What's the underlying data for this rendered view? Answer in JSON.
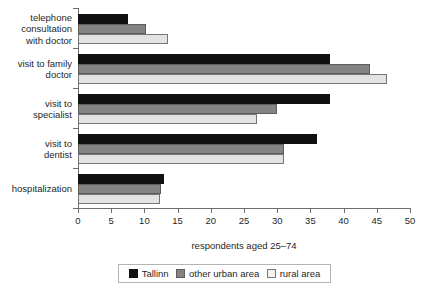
{
  "chart_data": {
    "type": "bar",
    "orientation": "horizontal",
    "title": "",
    "xlabel": "respondents aged 25–74",
    "ylabel": "",
    "xlim": [
      0,
      50
    ],
    "xticks": [
      0,
      5,
      10,
      15,
      20,
      25,
      30,
      35,
      40,
      45,
      50
    ],
    "xtick_labels": [
      "0",
      "5",
      "10",
      "15",
      "20",
      "25",
      "30",
      "35",
      "40",
      "45",
      "50"
    ],
    "grid": false,
    "legend_position": "bottom",
    "categories": [
      "telephone\nconsultation\nwith doctor",
      "visit to family\ndoctor",
      "visit to\nspecialist",
      "visit to\ndentist",
      "hospitalization"
    ],
    "series": [
      {
        "name": "Tallinn",
        "color": "#111111",
        "values": [
          7.5,
          38.0,
          38.0,
          36.0,
          13.0
        ]
      },
      {
        "name": "other urban area",
        "color": "#848484",
        "values": [
          10.2,
          44.0,
          30.0,
          31.0,
          12.5
        ]
      },
      {
        "name": "rural area",
        "color": "#e2e2e2",
        "values": [
          13.5,
          46.5,
          27.0,
          31.0,
          12.3
        ]
      }
    ]
  },
  "legend": {
    "items": [
      {
        "label": "Tallinn"
      },
      {
        "label": "other urban area"
      },
      {
        "label": "rural area"
      }
    ]
  },
  "axis": {
    "x_title": "respondents aged 25–74"
  }
}
